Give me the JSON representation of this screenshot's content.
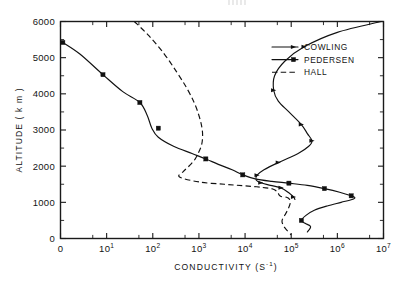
{
  "figure": {
    "artifact_top": "",
    "background_color": "#ffffff",
    "ink_color": "#111111"
  },
  "chart_data": {
    "type": "line",
    "title": "",
    "xlabel": "CONDUCTIVITY",
    "xlabel_units": "(S⁻¹)",
    "ylabel": "ALTITUDE  ( k m )",
    "xscale": "log",
    "yscale": "linear",
    "xlim": [
      0,
      7
    ],
    "ylim": [
      0,
      6000
    ],
    "grid": false,
    "legend_position": "upper right",
    "x_tick_labels": [
      "0",
      "10¹",
      "10²",
      "10³",
      "10⁴",
      "10⁵",
      "10⁶",
      "10⁷"
    ],
    "x_tick_mantissas": [
      "0",
      "10",
      "10",
      "10",
      "10",
      "10",
      "10",
      "10"
    ],
    "x_tick_exponents": [
      "",
      "1",
      "2",
      "3",
      "4",
      "5",
      "6",
      "7"
    ],
    "x_tick_decades": [
      0,
      1,
      2,
      3,
      4,
      5,
      6,
      7
    ],
    "y_tick_labels": [
      "0",
      "1000",
      "2000",
      "3000",
      "4000",
      "5000",
      "6000"
    ],
    "y_tick_values": [
      0,
      1000,
      2000,
      3000,
      4000,
      5000,
      6000
    ],
    "series": [
      {
        "name": "COWLING",
        "style": "solid",
        "marker": "arrow",
        "x_decades": [
          6.95,
          6.0,
          5.28,
          4.86,
          4.64,
          4.62,
          4.72,
          4.95,
          5.22,
          5.35,
          5.45,
          5.38,
          5.15,
          4.72,
          4.41,
          4.26,
          4.24,
          4.34,
          4.55,
          4.78,
          4.96,
          5.05,
          5.08
        ],
        "y_values": [
          6000,
          5700,
          5300,
          4900,
          4500,
          4100,
          3800,
          3500,
          3150,
          2900,
          2700,
          2550,
          2350,
          2100,
          1900,
          1750,
          1620,
          1540,
          1470,
          1400,
          1250,
          1150,
          1080
        ],
        "marker_x_decades": [
          5.28,
          4.62,
          5.22,
          5.45,
          4.72,
          4.26,
          4.34,
          4.78,
          5.05
        ],
        "marker_y_values": [
          5300,
          4100,
          3150,
          2700,
          2100,
          1750,
          1540,
          1400,
          1150
        ]
      },
      {
        "name": "PEDERSEN",
        "style": "solid",
        "marker": "square",
        "x_decades": [
          0.05,
          0.42,
          0.92,
          1.35,
          1.72,
          1.88,
          1.98,
          2.12,
          2.45,
          2.85,
          3.15,
          3.42,
          3.72,
          3.95,
          4.22,
          4.58,
          4.95,
          5.35,
          5.72,
          6.05,
          6.3,
          6.38,
          6.32,
          6.08,
          5.78,
          5.5,
          5.32,
          5.22,
          5.3,
          5.42,
          5.35
        ],
        "y_values": [
          5420,
          5100,
          4530,
          4060,
          3760,
          3400,
          3050,
          2800,
          2550,
          2350,
          2200,
          2050,
          1900,
          1760,
          1650,
          1580,
          1530,
          1470,
          1380,
          1280,
          1180,
          1130,
          1080,
          1000,
          900,
          780,
          640,
          500,
          420,
          330,
          180
        ],
        "marker_x_decades": [
          0.05,
          0.92,
          1.72,
          2.12,
          3.15,
          3.95,
          4.95,
          5.72,
          6.3,
          5.22
        ],
        "marker_y_values": [
          5420,
          4530,
          3760,
          3050,
          2200,
          1760,
          1530,
          1380,
          1180,
          500
        ]
      },
      {
        "name": "HALL",
        "style": "dashed",
        "marker": "none",
        "x_decades": [
          1.6,
          1.92,
          2.25,
          2.52,
          2.74,
          2.9,
          3.0,
          3.06,
          3.08,
          3.06,
          3.0,
          2.92,
          2.8,
          2.66,
          2.58,
          3.02,
          3.55,
          3.95,
          4.25,
          4.45,
          4.6,
          4.66,
          4.7,
          4.72,
          4.74,
          4.78,
          4.9,
          4.96,
          4.98,
          4.96,
          4.92,
          4.86,
          4.8,
          4.86,
          5.0
        ],
        "y_values": [
          6000,
          5600,
          5100,
          4600,
          4150,
          3750,
          3400,
          3100,
          2850,
          2600,
          2400,
          2200,
          2020,
          1850,
          1700,
          1560,
          1500,
          1460,
          1430,
          1400,
          1370,
          1330,
          1290,
          1250,
          1200,
          1160,
          1140,
          1090,
          1000,
          900,
          780,
          640,
          480,
          300,
          100
        ]
      }
    ],
    "legend": [
      {
        "label": "COWLING",
        "style": "solid",
        "marker": "arrow"
      },
      {
        "label": "PEDERSEN",
        "style": "solid",
        "marker": "square"
      },
      {
        "label": "HALL",
        "style": "dashed",
        "marker": "none"
      }
    ]
  }
}
